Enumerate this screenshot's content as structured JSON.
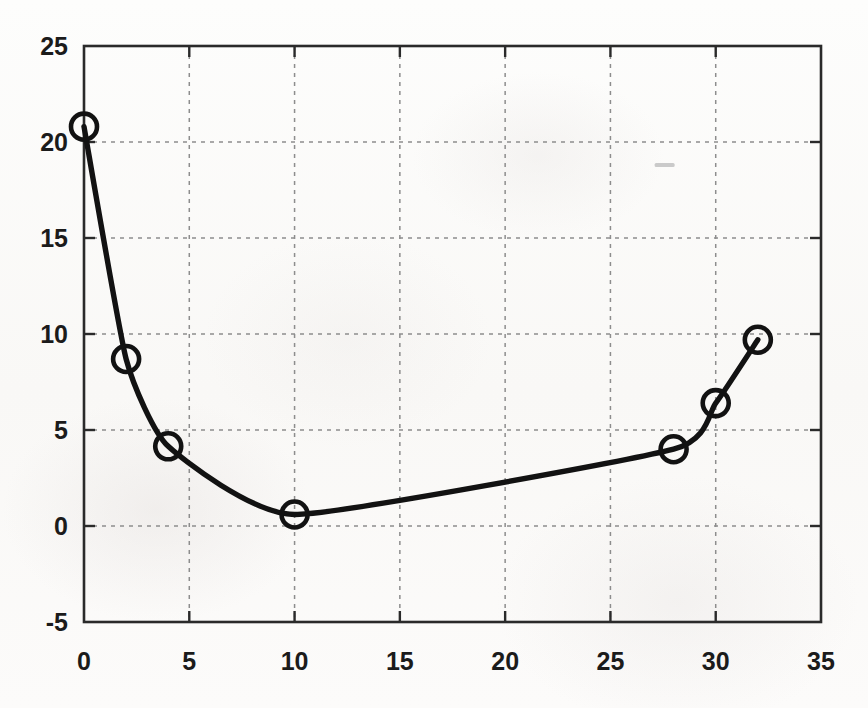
{
  "chart_data": {
    "type": "line",
    "title": "",
    "subtitle": "",
    "xlabel": "",
    "ylabel": "",
    "xlim": [
      0,
      35
    ],
    "ylim": [
      -5,
      25
    ],
    "grid": true,
    "legend": null,
    "legend_position": "none",
    "marker": "open-circle",
    "line_style": "solid-smooth",
    "line_color": "#121212",
    "grid_color": "#8d8d8d",
    "axis_color": "#2a2a2a",
    "background_color": "#fbfbfa",
    "x_ticks": [
      0,
      5,
      10,
      15,
      20,
      25,
      30,
      35
    ],
    "y_ticks": [
      -5,
      0,
      5,
      10,
      15,
      20,
      25
    ],
    "x_tick_labels": [
      "0",
      "5",
      "10",
      "15",
      "20",
      "25",
      "30",
      "35"
    ],
    "y_tick_labels": [
      "-5",
      "0",
      "5",
      "10",
      "15",
      "20",
      "25"
    ],
    "series": [
      {
        "name": "",
        "x": [
          0,
          2,
          4,
          10,
          28,
          30,
          32
        ],
        "y": [
          20.8,
          8.7,
          4.15,
          0.6,
          4.0,
          6.4,
          9.7
        ]
      }
    ],
    "annotations": [
      {
        "name": "scan-artifact-dash",
        "x": 27.1,
        "y": 18.9
      }
    ]
  }
}
